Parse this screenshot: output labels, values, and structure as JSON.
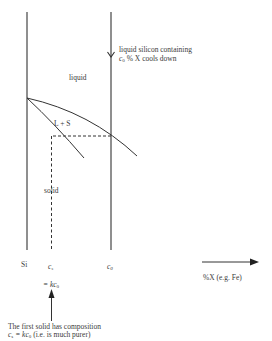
{
  "diagram": {
    "type": "phase-diagram-segregation",
    "axes": {
      "left_axis_label": "Si",
      "x_axis_label": "%X (e.g. Fe)"
    },
    "regions": {
      "liquid": "liquid",
      "two_phase": "L + S",
      "solid": "solid"
    },
    "markers": {
      "cs": "c",
      "cs_sub": "s",
      "c0": "c",
      "c0_sub": "0",
      "eq_prefix": "= k",
      "eq_c": "c",
      "eq_sub": "0"
    },
    "annotations": {
      "cooling_line1": "liquid silicon containing",
      "cooling_line2_var": "c",
      "cooling_line2_sub": "0",
      "cooling_line2_rest": " % X cools down",
      "first_solid_line1": "The first solid has composition",
      "first_solid_line2_a": "c",
      "first_solid_line2_a_sub": "s",
      "first_solid_line2_eq": " = k",
      "first_solid_line2_c": "c",
      "first_solid_line2_c_sub": "0",
      "first_solid_line2_rest": " (i.e. is much purer)"
    },
    "colors": {
      "line": "#333333",
      "text": "#3a3a3a"
    }
  }
}
